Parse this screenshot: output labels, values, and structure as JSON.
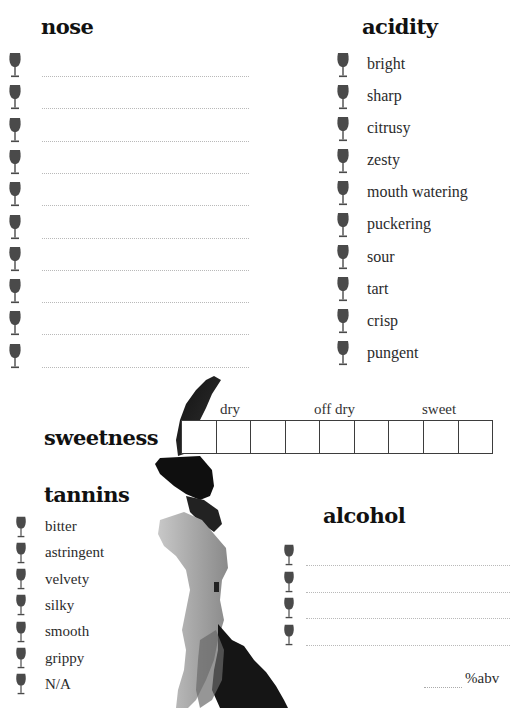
{
  "nose": {
    "title": "nose",
    "line_count": 10
  },
  "acidity": {
    "title": "acidity",
    "items": [
      "bright",
      "sharp",
      "citrusy",
      "zesty",
      "mouth watering",
      "puckering",
      "sour",
      "tart",
      "crisp",
      "pungent"
    ]
  },
  "sweetness": {
    "title": "sweetness",
    "scale_labels": [
      "dry",
      "off dry",
      "sweet"
    ],
    "box_count": 9
  },
  "tannins": {
    "title": "tannins",
    "items": [
      "bitter",
      "astringent",
      "velvety",
      "silky",
      "smooth",
      "grippy",
      "N/A"
    ]
  },
  "alcohol": {
    "title": "alcohol",
    "line_count": 4,
    "abv_label": "%abv"
  },
  "icons": {
    "bullet": "wine-glass-icon",
    "decoration": "ink-splash"
  },
  "colors": {
    "glass": "#4a4a4a",
    "title": "#111111",
    "rule": "#b9b9b9",
    "box_border": "#3d3d3d"
  }
}
